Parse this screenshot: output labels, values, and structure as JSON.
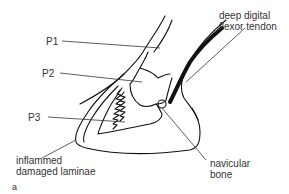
{
  "diagram": {
    "panel_label": "a",
    "labels": {
      "p1": "P1",
      "p2": "P2",
      "p3": "P3",
      "ddft": "deep digital\nflexor tendon",
      "laminae": "inflammed\ndamaged laminae",
      "navicular": "navicular\nbone"
    },
    "colors": {
      "stroke": "#111111",
      "leader": "#333333",
      "text": "#333333",
      "background": "#ffffff"
    }
  }
}
